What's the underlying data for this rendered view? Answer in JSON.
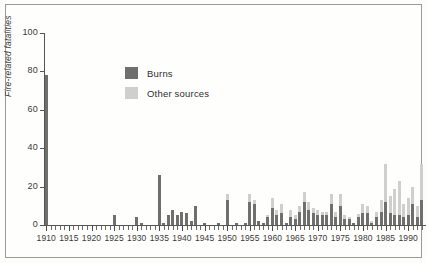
{
  "chart_data": {
    "type": "bar",
    "subtype": "stacked",
    "title": "",
    "xlabel": "",
    "ylabel": "Fire-related fatalities",
    "ylim": [
      0,
      100
    ],
    "yticks": [
      0,
      20,
      40,
      60,
      80,
      100
    ],
    "xlim": [
      1909.5,
      1993.5
    ],
    "xticks_major": [
      1910,
      1915,
      1920,
      1925,
      1930,
      1935,
      1940,
      1945,
      1950,
      1955,
      1960,
      1965,
      1970,
      1975,
      1980,
      1985,
      1990
    ],
    "grid": false,
    "legend": {
      "position": "upper-center-left",
      "entries": [
        {
          "label": "Burns",
          "color": "#6f6f6d"
        },
        {
          "label": "Other sources",
          "color": "#cfcfcb"
        }
      ]
    },
    "categories": [
      1910,
      1911,
      1912,
      1913,
      1914,
      1915,
      1916,
      1917,
      1918,
      1919,
      1920,
      1921,
      1922,
      1923,
      1924,
      1925,
      1926,
      1927,
      1928,
      1929,
      1930,
      1931,
      1932,
      1933,
      1934,
      1935,
      1936,
      1937,
      1938,
      1939,
      1940,
      1941,
      1942,
      1943,
      1944,
      1945,
      1946,
      1947,
      1948,
      1949,
      1950,
      1951,
      1952,
      1953,
      1954,
      1955,
      1956,
      1957,
      1958,
      1959,
      1960,
      1961,
      1962,
      1963,
      1964,
      1965,
      1966,
      1967,
      1968,
      1969,
      1970,
      1971,
      1972,
      1973,
      1974,
      1975,
      1976,
      1977,
      1978,
      1979,
      1980,
      1981,
      1982,
      1983,
      1984,
      1985,
      1986,
      1987,
      1988,
      1989,
      1990,
      1991,
      1992,
      1993
    ],
    "series": [
      {
        "name": "Burns",
        "color": "#6f6f6d",
        "values": [
          78,
          0,
          0,
          0,
          0,
          0,
          0,
          0,
          0,
          0,
          0,
          0,
          0,
          0,
          0,
          5,
          0,
          0,
          0,
          0,
          4,
          1,
          0,
          0,
          0,
          26,
          1,
          5,
          8,
          5,
          7,
          6,
          2,
          10,
          0,
          1,
          0,
          0,
          1,
          0,
          13,
          0,
          1,
          0,
          1,
          12,
          11,
          2,
          1,
          4,
          9,
          5,
          6,
          1,
          4,
          3,
          7,
          12,
          8,
          6,
          5,
          5,
          5,
          11,
          4,
          10,
          3,
          3,
          1,
          4,
          6,
          6,
          1,
          4,
          7,
          12,
          6,
          5,
          5,
          4,
          5,
          11,
          4,
          13
        ]
      },
      {
        "name": "Other sources",
        "color": "#cfcfcb",
        "values": [
          0,
          0,
          0,
          0,
          0,
          0,
          0,
          0,
          0,
          0,
          0,
          0,
          0,
          0,
          0,
          0,
          0,
          0,
          0,
          0,
          0,
          0,
          0,
          0,
          0,
          0,
          0,
          0,
          0,
          0,
          0,
          0,
          0,
          0,
          0,
          0,
          0,
          0,
          0,
          0,
          3,
          0,
          0,
          0,
          0,
          4,
          2,
          0,
          0,
          1,
          5,
          3,
          5,
          0,
          4,
          2,
          3,
          5,
          4,
          3,
          3,
          2,
          2,
          5,
          3,
          6,
          2,
          1,
          0,
          2,
          5,
          4,
          1,
          3,
          6,
          20,
          9,
          14,
          18,
          7,
          9,
          9,
          6,
          19
        ]
      }
    ]
  }
}
